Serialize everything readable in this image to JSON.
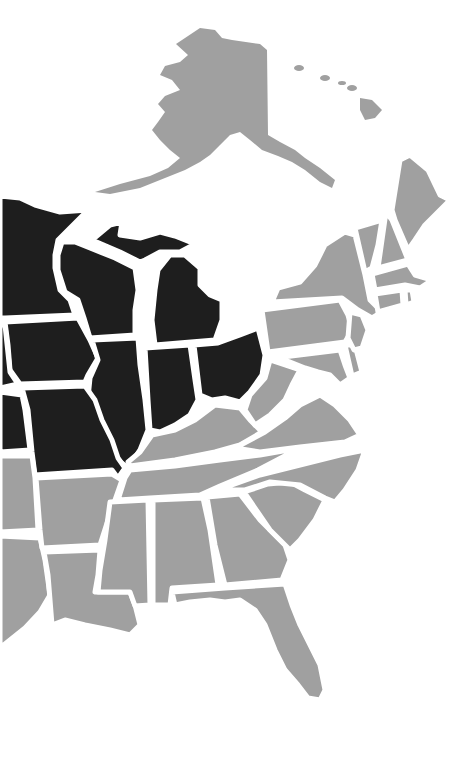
{
  "map": {
    "title": "Midwest states highlighted on US map",
    "colors": {
      "highlighted": "#1e1e1e",
      "other": "#a0a0a0",
      "border": "#ffffff",
      "background": "#ffffff"
    },
    "highlighted_states": [
      "Minnesota",
      "Wisconsin",
      "Michigan",
      "Iowa",
      "Illinois",
      "Indiana",
      "Ohio",
      "Missouri",
      "Nebraska",
      "Kansas",
      "South Dakota",
      "North Dakota"
    ],
    "other_states_visible": [
      "Alaska",
      "Hawaii",
      "Maine",
      "New Hampshire",
      "Vermont",
      "Massachusetts",
      "Rhode Island",
      "Connecticut",
      "New York",
      "New Jersey",
      "Pennsylvania",
      "Delaware",
      "Maryland",
      "West Virginia",
      "Virginia",
      "Kentucky",
      "Tennessee",
      "North Carolina",
      "South Carolina",
      "Georgia",
      "Florida",
      "Alabama",
      "Mississippi",
      "Arkansas",
      "Louisiana",
      "Oklahoma",
      "Texas"
    ]
  }
}
